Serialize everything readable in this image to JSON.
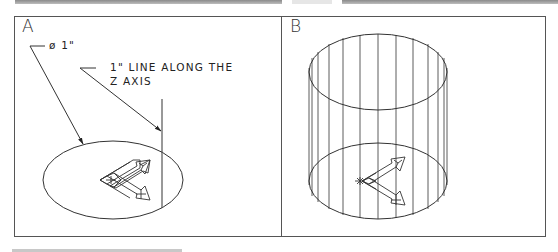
{
  "figure": {
    "panels": [
      {
        "id": "A",
        "label": "A",
        "annotations": {
          "diameter_note": "ø 1\"",
          "line_note_line1": "1\" LINE ALONG THE",
          "line_note_line2": "Z AXIS"
        },
        "elements": [
          "circle-ellipse",
          "ucs-icon",
          "z-axis-line",
          "leader-arrows"
        ]
      },
      {
        "id": "B",
        "label": "B",
        "elements": [
          "wireframe-cylinder",
          "ucs-icon"
        ]
      }
    ],
    "colors": {
      "line": "#333333",
      "border": "#555555",
      "background": "#ffffff",
      "top_bar": "#9a9a9a"
    }
  }
}
